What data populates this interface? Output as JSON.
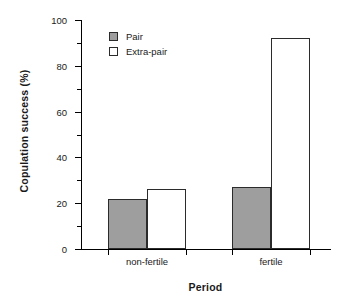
{
  "chart_data": {
    "type": "bar",
    "title": "",
    "xlabel": "Period",
    "ylabel": "Copulation success (%)",
    "categories": [
      "non-fertile",
      "fertile"
    ],
    "series": [
      {
        "name": "Pair",
        "values": [
          22,
          27
        ],
        "color": "#9e9e9e"
      },
      {
        "name": "Extra-pair",
        "values": [
          26,
          92
        ],
        "color": "#ffffff"
      }
    ],
    "ylim": [
      0,
      100
    ],
    "ytick_labels": [
      "0",
      "20",
      "40",
      "60",
      "80",
      "100"
    ],
    "ytick_values": [
      0,
      20,
      40,
      60,
      80,
      100
    ],
    "yminor_values": [
      10,
      30,
      50,
      70,
      90
    ],
    "grid": false,
    "legend_position": "top-left",
    "legend": [
      "Pair",
      "Extra-pair"
    ],
    "bar_edge_color": "#2b2b2b",
    "axis_color": "#000000"
  },
  "axis": {
    "y_title": "Copulation success (%)",
    "x_title": "Period",
    "y_tick_0": "0",
    "y_tick_20": "20",
    "y_tick_40": "40",
    "y_tick_60": "60",
    "y_tick_80": "80",
    "y_tick_100": "100",
    "x_tick_1": "non-fertile",
    "x_tick_2": "fertile"
  },
  "legend": {
    "pair_label": "Pair",
    "extrapair_label": "Extra-pair"
  }
}
